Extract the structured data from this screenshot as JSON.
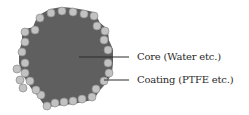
{
  "diagram": {
    "type": "core-shell-particle",
    "colors": {
      "core_fill": "#5f5f5f",
      "coating_fill": "#c2c2c2",
      "coating_stroke": "#8c8c8c",
      "leader_line": "#2a2a2a",
      "text": "#2a2a2a",
      "background": "#ffffff"
    },
    "core": {
      "shape_points": "40,18 51,12 62,10 73,11 84,13 93,15 97,24 105,31 106,41 110,50 110,63 109,73 104,81 97,89 92,97 82,99 73,101 64,102 55,103 47,104 41,95 36,90 30,81 25,73 22,63 22,52 25,42 25,32 35,30",
      "label": "Core (Water etc.)"
    },
    "coating": {
      "particle_radius": 4,
      "particles": [
        [
          40,
          18
        ],
        [
          51,
          13
        ],
        [
          62,
          11
        ],
        [
          73,
          12
        ],
        [
          84,
          14
        ],
        [
          94,
          16
        ],
        [
          97,
          26
        ],
        [
          105,
          31
        ],
        [
          104,
          40
        ],
        [
          108,
          50
        ],
        [
          108,
          63
        ],
        [
          109,
          73
        ],
        [
          104,
          81
        ],
        [
          96,
          89
        ],
        [
          92,
          97
        ],
        [
          82,
          99
        ],
        [
          73,
          101
        ],
        [
          64,
          102
        ],
        [
          55,
          103
        ],
        [
          47,
          106
        ],
        [
          41,
          95
        ],
        [
          36,
          90
        ],
        [
          30,
          81
        ],
        [
          23,
          88
        ],
        [
          20,
          80
        ],
        [
          25,
          73
        ],
        [
          17,
          69
        ],
        [
          25,
          63
        ],
        [
          22,
          52
        ],
        [
          25,
          42
        ],
        [
          25,
          32
        ],
        [
          35,
          30
        ]
      ],
      "label": "Coating (PTFE etc.)"
    },
    "leaders": [
      {
        "id": "core",
        "x1": 79,
        "y1": 57,
        "x2": 129,
        "y2": 57
      },
      {
        "id": "coating",
        "x1": 104,
        "y1": 80,
        "x2": 129,
        "y2": 80
      }
    ]
  },
  "labels": {
    "core": "Core (Water etc.)",
    "coating": "Coating (PTFE etc.)"
  }
}
